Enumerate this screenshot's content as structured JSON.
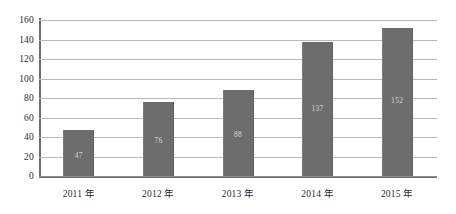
{
  "top_clipped_text": "· · · · · · · · · ·",
  "chart_data": {
    "type": "bar",
    "title": "",
    "xlabel": "",
    "ylabel": "",
    "categories": [
      "2011 年",
      "2012 年",
      "2013 年",
      "2014 年",
      "2015 年"
    ],
    "values": [
      47,
      76,
      88,
      137,
      152
    ],
    "value_labels": [
      "47",
      "76",
      "88",
      "137",
      "152"
    ],
    "ylim": [
      0,
      160
    ],
    "ytick_step": 20,
    "yticks": [
      "0",
      "20",
      "40",
      "60",
      "80",
      "100",
      "120",
      "140",
      "160"
    ],
    "grid": "horizontal",
    "legend": "none",
    "bar_color": "#6d6d6d",
    "value_label_color": "#e4e4e4",
    "gridline_color": "#b9b9b9",
    "axis_color": "#6e6e6e",
    "background_color": "#ffffff"
  }
}
